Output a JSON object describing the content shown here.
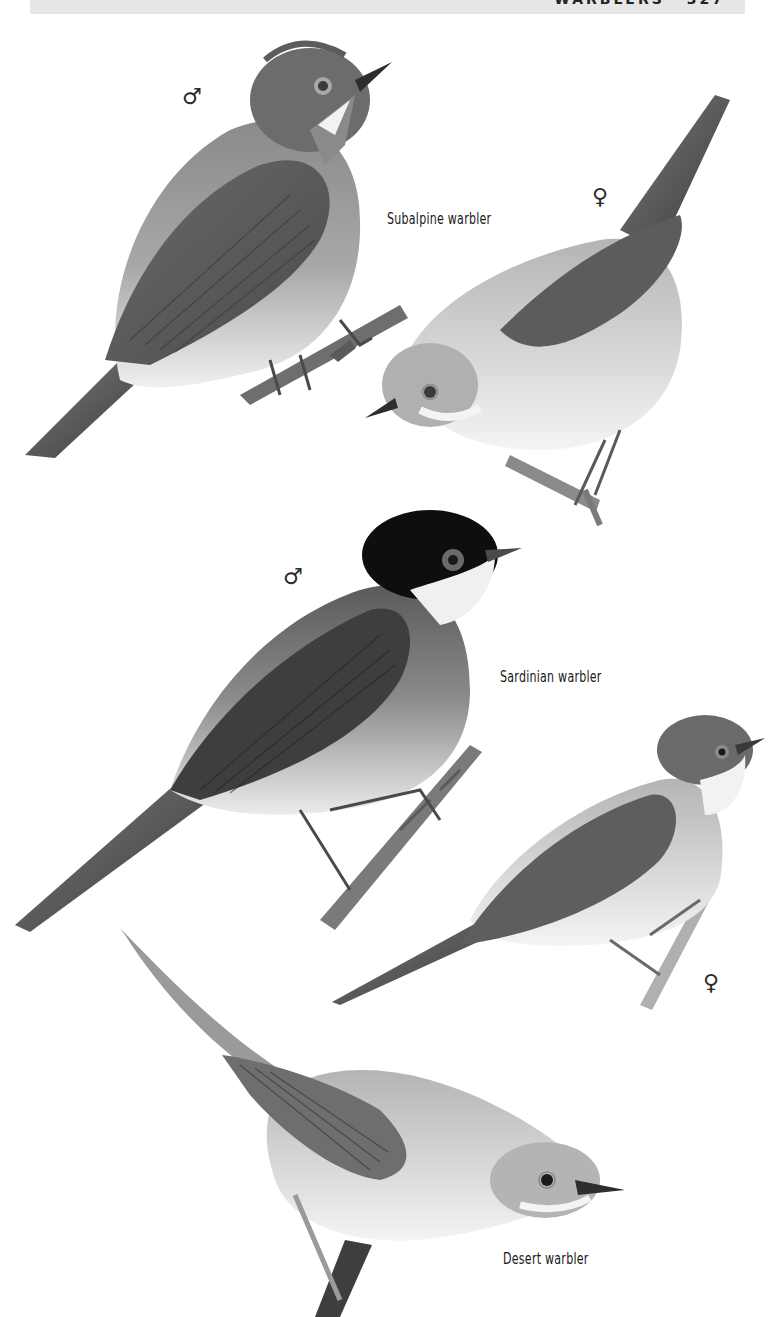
{
  "page": {
    "running_header": "WARBLERS",
    "page_number": "327"
  },
  "plate": {
    "species": [
      {
        "name": "Subalpine warbler",
        "figures": [
          {
            "sex": "male",
            "symbol": "♂"
          },
          {
            "sex": "female",
            "symbol": "♀"
          }
        ]
      },
      {
        "name": "Sardinian warbler",
        "figures": [
          {
            "sex": "male",
            "symbol": "♂"
          },
          {
            "sex": "female",
            "symbol": "♀"
          }
        ]
      },
      {
        "name": "Desert warbler",
        "figures": []
      }
    ]
  },
  "colors": {
    "header_band": "#e6e6e6",
    "text": "#1a1a1a",
    "paper": "#ffffff"
  }
}
